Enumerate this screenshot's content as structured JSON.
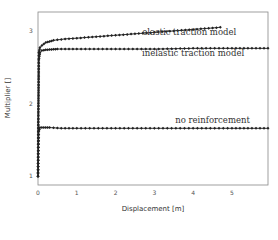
{
  "chart_data": {
    "type": "line",
    "title": "",
    "xlabel": "Displacement [m]",
    "ylabel": "Multiplier []",
    "xlim": [
      0,
      5.93
    ],
    "ylim": [
      0.88,
      3.26
    ],
    "xticks": [
      "0",
      "1",
      "2",
      "3",
      "4",
      "5"
    ],
    "yticks": [
      "1",
      "2",
      "3"
    ],
    "grid": false,
    "legend": "inline annotations",
    "series": [
      {
        "name": "elastic traction model",
        "marker": "diamond",
        "x": [
          0,
          0.02,
          0.05,
          0.1,
          0.2,
          0.4,
          0.7,
          1.0,
          1.5,
          2.0,
          2.5,
          3.0,
          3.5,
          4.0,
          4.5,
          4.7
        ],
        "y": [
          1.0,
          2.7,
          2.77,
          2.8,
          2.84,
          2.87,
          2.89,
          2.9,
          2.92,
          2.94,
          2.96,
          2.98,
          3.0,
          3.02,
          3.04,
          3.05
        ]
      },
      {
        "name": "inelastic traction model",
        "marker": "diamond",
        "x": [
          0,
          0.02,
          0.05,
          0.1,
          0.2,
          0.5,
          1.0,
          2.0,
          3.0,
          4.0,
          5.0,
          5.93
        ],
        "y": [
          1.0,
          2.6,
          2.7,
          2.73,
          2.74,
          2.75,
          2.75,
          2.75,
          2.75,
          2.76,
          2.76,
          2.76
        ]
      },
      {
        "name": "no reinforcement",
        "marker": "diamond",
        "x": [
          0,
          0.02,
          0.05,
          0.1,
          0.3,
          0.6,
          1.0,
          2.0,
          3.0,
          4.0,
          5.0,
          5.93
        ],
        "y": [
          1.0,
          1.62,
          1.67,
          1.67,
          1.67,
          1.66,
          1.66,
          1.66,
          1.66,
          1.66,
          1.66,
          1.66
        ]
      }
    ],
    "annotations": [
      {
        "text": "elastic traction model",
        "x": 3.9,
        "y": 2.95
      },
      {
        "text": "inelastic traction model",
        "x": 4.0,
        "y": 2.66
      },
      {
        "text": "no reinforcement",
        "x": 4.5,
        "y": 1.73
      }
    ]
  }
}
